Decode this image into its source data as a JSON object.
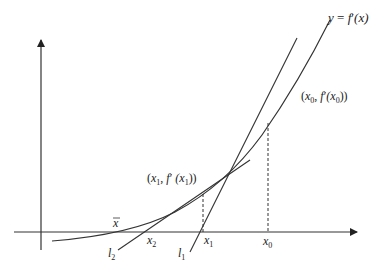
{
  "diagram": {
    "colors": {
      "stroke": "#333333",
      "text": "#222222",
      "background": "#ffffff"
    },
    "axes": {
      "x_axis": "horizontal axis with arrow",
      "y_axis": "vertical axis with arrow"
    },
    "curve_label": {
      "y": "y",
      "eq": " = ",
      "f": "f",
      "prime": "′",
      "arg": "(x)"
    },
    "points": {
      "p0": {
        "open": "(",
        "x": "x",
        "sub": "0",
        "comma": ", ",
        "f": "f",
        "prime": "′",
        "argx": "(x",
        "argsub": "0",
        "close": "))"
      },
      "p1": {
        "open": "(",
        "x": "x",
        "sub": "1",
        "comma": ", ",
        "f": "f",
        "prime": "′",
        "argx": " (x",
        "argsub": "1",
        "close": "))"
      }
    },
    "x_ticks": [
      {
        "name": "x-bar",
        "base": "x",
        "bar": true
      },
      {
        "name": "x2",
        "base": "x",
        "sub": "2"
      },
      {
        "name": "x1",
        "base": "x",
        "sub": "1"
      },
      {
        "name": "x0",
        "base": "x",
        "sub": "0"
      }
    ],
    "tangent_lines": [
      {
        "name": "l1",
        "base": "l",
        "sub": "1",
        "description": "tangent at (x0, f'(x0))"
      },
      {
        "name": "l2",
        "base": "l",
        "sub": "2",
        "description": "tangent at (x1, f'(x1))"
      }
    ]
  }
}
